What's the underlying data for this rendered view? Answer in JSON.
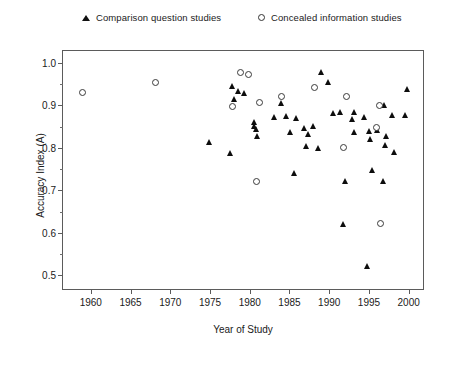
{
  "chart_data": {
    "type": "scatter",
    "title": "",
    "xlabel": "Year of Study",
    "ylabel": "Accuracy Index (A)",
    "xlim": [
      1956.5,
      2001.8
    ],
    "ylim": [
      0.468,
      1.028
    ],
    "xticks": [
      1960,
      1965,
      1970,
      1975,
      1980,
      1985,
      1990,
      1995,
      2000
    ],
    "yticks": [
      0.5,
      0.6,
      0.7,
      0.8,
      0.9,
      1.0
    ],
    "ytick_labels": [
      "0.5",
      "0.6",
      "0.7",
      "0.8",
      "0.9",
      "1.0"
    ],
    "xtick_labels": [
      "1960",
      "1965",
      "1970",
      "1975",
      "1980",
      "1985",
      "1990",
      "1995",
      "2000"
    ],
    "y_minor_ticks": [
      0.55,
      0.65,
      0.75,
      0.85,
      0.95
    ],
    "grid": false,
    "legend_position": "above-plot",
    "marker_color": "#0d0d0d",
    "frame_color": "#5b5b5b",
    "series": [
      {
        "name": "Comparison question studies",
        "marker": "triangle",
        "points": [
          [
            1975.0,
            0.815
          ],
          [
            1977.9,
            0.945
          ],
          [
            1978.6,
            0.935
          ],
          [
            1979.4,
            0.93
          ],
          [
            1978.1,
            0.915
          ],
          [
            1980.6,
            0.862
          ],
          [
            1980.6,
            0.852
          ],
          [
            1980.9,
            0.845
          ],
          [
            1981.0,
            0.828
          ],
          [
            1977.6,
            0.788
          ],
          [
            1984.0,
            0.905
          ],
          [
            1983.1,
            0.872
          ],
          [
            1984.6,
            0.875
          ],
          [
            1985.9,
            0.87
          ],
          [
            1986.9,
            0.848
          ],
          [
            1985.2,
            0.838
          ],
          [
            1987.4,
            0.832
          ],
          [
            1988.0,
            0.852
          ],
          [
            1987.2,
            0.805
          ],
          [
            1988.6,
            0.8
          ],
          [
            1985.6,
            0.742
          ],
          [
            1989.0,
            0.978
          ],
          [
            1989.9,
            0.955
          ],
          [
            1990.6,
            0.882
          ],
          [
            1991.4,
            0.885
          ],
          [
            1993.2,
            0.884
          ],
          [
            1993.0,
            0.868
          ],
          [
            1994.5,
            0.872
          ],
          [
            1997.0,
            0.9
          ],
          [
            1998.0,
            0.878
          ],
          [
            1999.8,
            0.938
          ],
          [
            1999.6,
            0.878
          ],
          [
            1993.2,
            0.838
          ],
          [
            1995.1,
            0.84
          ],
          [
            1996.1,
            0.842
          ],
          [
            1995.2,
            0.82
          ],
          [
            1997.2,
            0.828
          ],
          [
            1997.1,
            0.808
          ],
          [
            1998.2,
            0.79
          ],
          [
            1995.5,
            0.748
          ],
          [
            1996.9,
            0.722
          ],
          [
            1992.0,
            0.722
          ],
          [
            1991.8,
            0.62
          ],
          [
            1994.8,
            0.522
          ]
        ]
      },
      {
        "name": "Concealed information studies",
        "marker": "circle",
        "points": [
          [
            1959.0,
            0.93
          ],
          [
            1968.2,
            0.955
          ],
          [
            1978.8,
            0.978
          ],
          [
            1979.8,
            0.972
          ],
          [
            1977.8,
            0.898
          ],
          [
            1981.2,
            0.908
          ],
          [
            1984.0,
            0.922
          ],
          [
            1988.2,
            0.942
          ],
          [
            1992.2,
            0.922
          ],
          [
            1996.3,
            0.9
          ],
          [
            1995.9,
            0.848
          ],
          [
            1991.8,
            0.802
          ],
          [
            1980.8,
            0.722
          ],
          [
            1996.4,
            0.622
          ]
        ]
      }
    ]
  }
}
